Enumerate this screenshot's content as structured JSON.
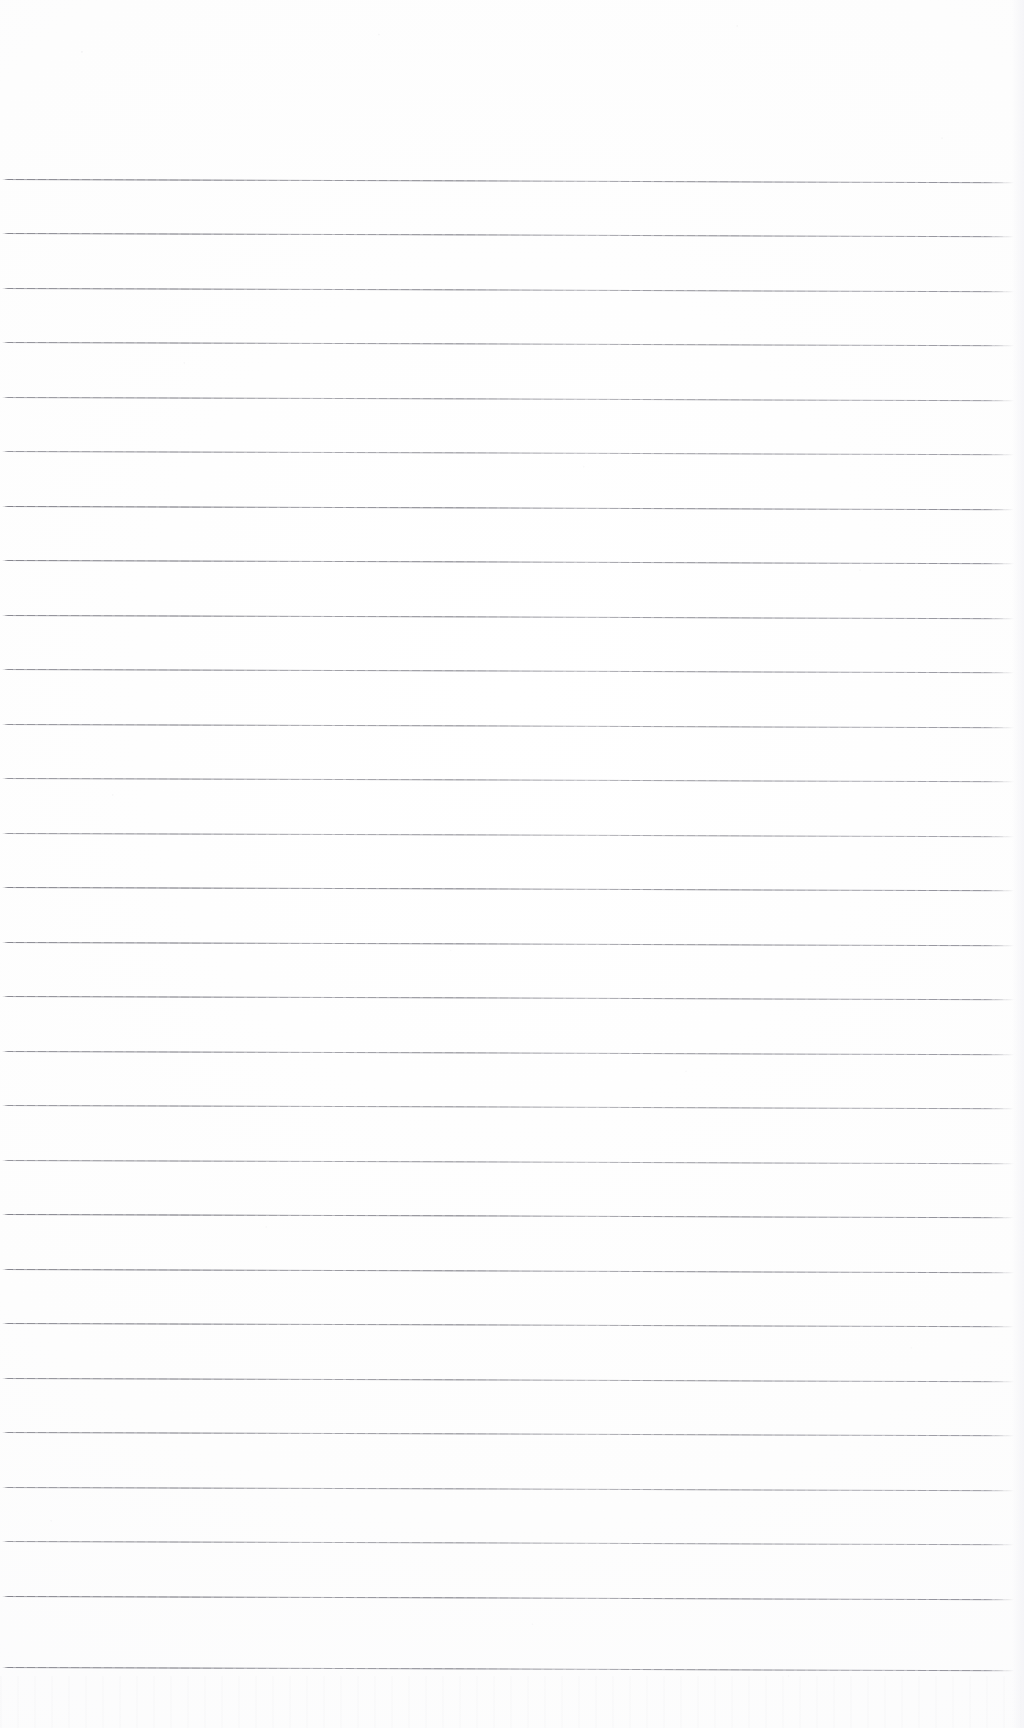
{
  "page": {
    "kind": "scanned-blank-ruled-notebook-page",
    "width": 1024,
    "height": 1728,
    "background_color": "#fdfdfd",
    "has_visible_text": false,
    "text_content": "",
    "top_margin_px": 179,
    "bottom_margin_px": 61
  },
  "ruling": {
    "line_color": "#64646e",
    "line_thickness_px": 1,
    "line_count": 28,
    "first_line_y": 179,
    "line_spacing_px": 54.5,
    "line_start_x": 2,
    "line_end_x": 1014,
    "skew_degrees": 0.18,
    "lines": [
      {
        "index": 1,
        "y": 179
      },
      {
        "index": 2,
        "y": 233
      },
      {
        "index": 3,
        "y": 288
      },
      {
        "index": 4,
        "y": 342
      },
      {
        "index": 5,
        "y": 397
      },
      {
        "index": 6,
        "y": 451
      },
      {
        "index": 7,
        "y": 506
      },
      {
        "index": 8,
        "y": 560
      },
      {
        "index": 9,
        "y": 615
      },
      {
        "index": 10,
        "y": 669
      },
      {
        "index": 11,
        "y": 724
      },
      {
        "index": 12,
        "y": 778
      },
      {
        "index": 13,
        "y": 833
      },
      {
        "index": 14,
        "y": 887
      },
      {
        "index": 15,
        "y": 942
      },
      {
        "index": 16,
        "y": 996
      },
      {
        "index": 17,
        "y": 1051
      },
      {
        "index": 18,
        "y": 1105
      },
      {
        "index": 19,
        "y": 1160
      },
      {
        "index": 20,
        "y": 1214
      },
      {
        "index": 21,
        "y": 1269
      },
      {
        "index": 22,
        "y": 1323
      },
      {
        "index": 23,
        "y": 1378
      },
      {
        "index": 24,
        "y": 1432
      },
      {
        "index": 25,
        "y": 1487
      },
      {
        "index": 26,
        "y": 1541
      },
      {
        "index": 27,
        "y": 1596
      },
      {
        "index": 28,
        "y": 1667
      }
    ]
  },
  "artifacts": {
    "right_edge_band_color": "#f2f2f6",
    "speckle_color": "#9696a0",
    "bottom_dust_band_height_px": 52
  }
}
